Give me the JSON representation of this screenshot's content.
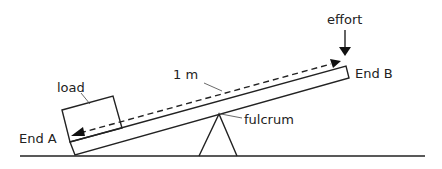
{
  "diagram": {
    "labels": {
      "effort": "effort",
      "end_b": "End B",
      "length": "1 m",
      "load": "load",
      "end_a": "End A",
      "fulcrum": "fulcrum"
    },
    "colors": {
      "line": "#222222",
      "background": "#ffffff"
    }
  }
}
